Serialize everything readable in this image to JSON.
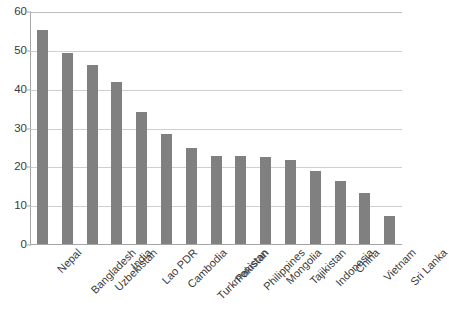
{
  "chart_data": {
    "type": "bar",
    "title": "",
    "subtitle": "",
    "xlabel": "",
    "ylabel": "",
    "categories": [
      "Nepal",
      "Bangladesh",
      "Uzbekistan",
      "India",
      "Lao PDR",
      "Cambodia",
      "Turkmenistan",
      "Pakistan",
      "Philippines",
      "Mongolia",
      "Tajikistan",
      "Indonesia",
      "China",
      "Vietnam",
      "Sri Lanka"
    ],
    "values": [
      55,
      49.3,
      46,
      41.7,
      33.9,
      28.3,
      24.8,
      22.7,
      22.6,
      22.4,
      21.6,
      18.7,
      16.2,
      13.2,
      7.2
    ],
    "ylim": [
      0,
      60
    ],
    "ytick_labels": [
      "60",
      "50",
      "40",
      "30",
      "20",
      "10",
      "0"
    ],
    "ytick_values": [
      60,
      50,
      40,
      30,
      20,
      10,
      0
    ],
    "ytick_interval": 10,
    "grid": true,
    "grid_axis": "y",
    "legend": false,
    "legend_position": "none",
    "series_color": "#808080",
    "gridline_color": "#cfcfcf",
    "axis_color": "#a6a6a6",
    "label_color": "#3a3a3a",
    "background": "#ffffff",
    "xtick_label_rotation": -45
  }
}
